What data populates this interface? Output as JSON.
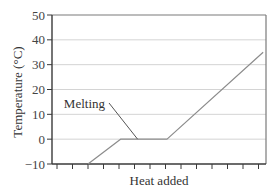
{
  "chart_data": {
    "type": "line",
    "title": "",
    "xlabel": "Heat added",
    "ylabel": "Temperature (°C)",
    "ylim": [
      -10,
      50
    ],
    "yticks": [
      -10,
      0,
      10,
      20,
      30,
      40,
      50
    ],
    "ytick_labels": [
      "−10",
      "0",
      "10",
      "20",
      "30",
      "40",
      "50"
    ],
    "x_ticks_count": 14,
    "x_tick_labels": [],
    "grid": {
      "horizontal": true,
      "vertical": false
    },
    "legend": null,
    "series": [
      {
        "name": "Heating curve",
        "color": "#8c8c8c",
        "points": [
          {
            "x": 2.0,
            "y": -10
          },
          {
            "x": 4.1,
            "y": 0
          },
          {
            "x": 7.1,
            "y": 0
          },
          {
            "x": 13.3,
            "y": 35
          }
        ]
      }
    ],
    "annotations": [
      {
        "text": "Melting",
        "points_to": {
          "x": 5.2,
          "y": 0
        }
      }
    ]
  },
  "colors": {
    "axis": "#3a3a3a",
    "frame": "#7a7a7a",
    "grid": "#d4d4d4",
    "line": "#8c8c8c",
    "leader": "#555555"
  }
}
